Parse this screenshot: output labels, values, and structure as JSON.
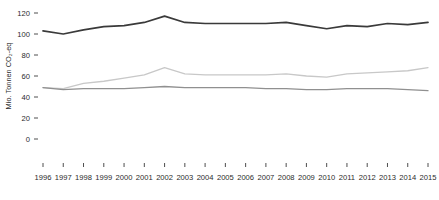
{
  "chart_data": {
    "type": "line",
    "title": "",
    "subtitle": "",
    "xlabel": "",
    "ylabel": "Mio. Tonnen CO₂-eq",
    "xlim": [
      1996,
      2015
    ],
    "ylim": [
      0,
      120
    ],
    "yticks": [
      0,
      20,
      40,
      60,
      80,
      100,
      120
    ],
    "ytick_labels": [
      "0",
      "20",
      "40",
      "60",
      "80",
      "100",
      "120"
    ],
    "x": [
      1996,
      1997,
      1998,
      1999,
      2000,
      2001,
      2002,
      2003,
      2004,
      2005,
      2006,
      2007,
      2008,
      2009,
      2010,
      2011,
      2012,
      2013,
      2014,
      2015
    ],
    "xtick_labels": [
      "1996",
      "1997",
      "1998",
      "1999",
      "2000",
      "2001",
      "2002",
      "2003",
      "2004",
      "2005",
      "2006",
      "2007",
      "2008",
      "2009",
      "2010",
      "2011",
      "2012",
      "2013",
      "2014",
      "2015"
    ],
    "grid": false,
    "legend": "none",
    "series": [
      {
        "name": "series-top",
        "color": "#3a3a3a",
        "width": 1.7,
        "values": [
          103,
          100,
          104,
          107,
          108,
          111,
          117,
          111,
          110,
          110,
          110,
          110,
          111,
          108,
          105,
          108,
          107,
          110,
          109,
          111
        ]
      },
      {
        "name": "series-middle",
        "color": "#c8c8c8",
        "width": 1.3,
        "values": [
          49,
          48,
          53,
          55,
          58,
          61,
          68,
          62,
          61,
          61,
          61,
          61,
          62,
          60,
          59,
          62,
          63,
          64,
          65,
          68
        ]
      },
      {
        "name": "series-bottom",
        "color": "#909090",
        "width": 1.3,
        "values": [
          49,
          47,
          48,
          48,
          48,
          49,
          50,
          49,
          49,
          49,
          49,
          48,
          48,
          47,
          47,
          48,
          48,
          48,
          47,
          46
        ]
      }
    ]
  },
  "plot_geometry": {
    "x_first": 43,
    "x_last": 428,
    "y_zero": 139,
    "y_max": 13,
    "tick_length": 4,
    "y_tick_x": 34,
    "y_label_x": 30,
    "x_label_y": 180,
    "x_tick_y": 163
  }
}
